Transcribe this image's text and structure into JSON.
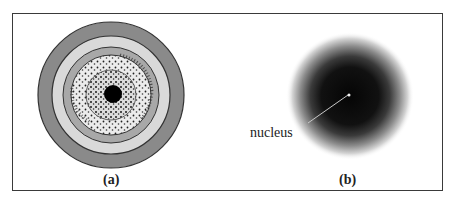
{
  "figure": {
    "panel_a": {
      "caption": "(a)",
      "description": "concentric shell model with dotted electron density",
      "colors": {
        "outer_ring": "#8a8a8a",
        "light_ring": "#d9d9d9",
        "mid_ring": "#a8a8a8",
        "inner_fill": "#e8e8e8",
        "core": "#000000"
      }
    },
    "panel_b": {
      "caption": "(b)",
      "annotation": "nucleus",
      "description": "diffuse electron cloud model",
      "colors": {
        "cloud": "#111111",
        "pointer": "#cccccc"
      }
    }
  }
}
